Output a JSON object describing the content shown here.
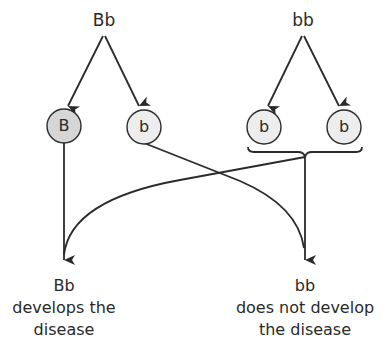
{
  "parents": {
    "left": {
      "genotype": "Bb"
    },
    "right": {
      "genotype": "bb"
    }
  },
  "alleles": [
    {
      "label": "B",
      "parent": "left",
      "dominant": true
    },
    {
      "label": "b",
      "parent": "left",
      "dominant": false
    },
    {
      "label": "b",
      "parent": "right",
      "dominant": false
    },
    {
      "label": "b",
      "parent": "right",
      "dominant": false
    }
  ],
  "offspring": {
    "left": {
      "genotype": "Bb",
      "line1": "develops the",
      "line2": "disease"
    },
    "right": {
      "genotype": "bb",
      "line1": "does not develop",
      "line2": "the disease"
    }
  },
  "colors": {
    "dominant_fill": "#d6d6d6",
    "recessive_fill": "#ededed",
    "stroke": "#2a2a2a"
  }
}
